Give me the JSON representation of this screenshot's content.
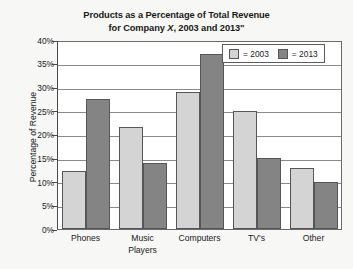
{
  "chart_data": {
    "type": "bar",
    "title": "Products as a Percentage of Total Revenue for Company X, 2003 and 2013\"",
    "title_lines": [
      "Products as a Percentage of Total Revenue",
      "for Company X, 2003 and 2013\""
    ],
    "title_line1": "Products as a Percentage of Total Revenue",
    "title_line2_before": "for Company ",
    "title_line2_italic": "X",
    "title_line2_after": ", 2003 and 2013\"",
    "xlabel": "",
    "ylabel": "Percentage of Revenue",
    "categories": [
      "Phones",
      "Music Players",
      "Computers",
      "TV's",
      "Other"
    ],
    "category_lines": [
      [
        "Phones"
      ],
      [
        "Music",
        "Players"
      ],
      [
        "Computers"
      ],
      [
        "TV's"
      ],
      [
        "Other"
      ]
    ],
    "series": [
      {
        "name": "2003",
        "legend_label": "= 2003",
        "color": "#d4d4d4",
        "values": [
          12.3,
          21.5,
          29.0,
          25.0,
          13.0
        ]
      },
      {
        "name": "2013",
        "legend_label": "= 2013",
        "color": "#848484",
        "values": [
          27.5,
          14.0,
          37.0,
          15.0,
          10.0
        ]
      }
    ],
    "ylim": [
      0,
      40
    ],
    "ytick_values": [
      0,
      5,
      10,
      15,
      20,
      25,
      30,
      35,
      40
    ],
    "ytick_labels": [
      "0%",
      "5%",
      "10%",
      "15%",
      "20%",
      "25%",
      "30%",
      "35%",
      "40%"
    ],
    "grid": true,
    "grid_axis": "y",
    "legend_position": "top-right-inside",
    "colors": {
      "background": "#f7f7f5",
      "plot_background": "#ffffff",
      "gridline": "#8a8a8a",
      "axis": "#4a4a4a",
      "bar_outline": "#55555a",
      "text": "#1a1a1a"
    }
  }
}
